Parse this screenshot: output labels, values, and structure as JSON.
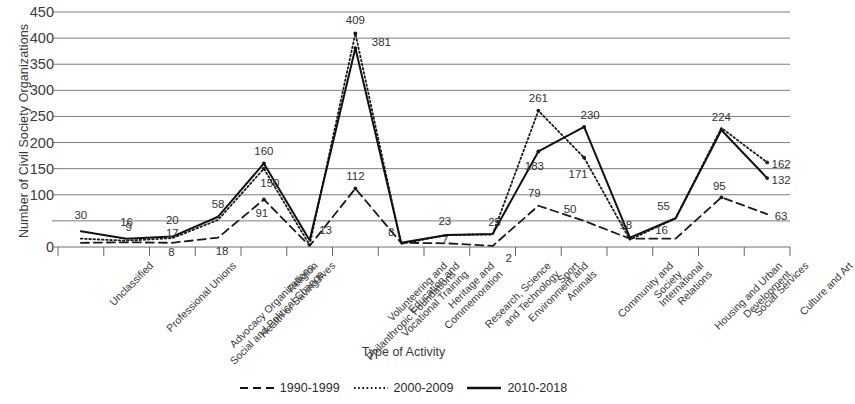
{
  "chart_data": {
    "type": "line",
    "title": "",
    "xlabel": "Type of Activity",
    "ylabel": "Number of Civil Society Organizations",
    "ylim": [
      0,
      450
    ],
    "yticks": [
      0,
      50,
      100,
      150,
      200,
      250,
      300,
      350,
      400,
      450
    ],
    "ytick_labels": [
      "0",
      "50",
      "100",
      "150",
      "200",
      "250",
      "300",
      "350",
      "400",
      "450"
    ],
    "grid": true,
    "legend_position": "bottom",
    "categories": [
      "Unclassified",
      "Professional Unions",
      "Advocacy Organizations,\nSocial and Political Change",
      "Health or Saving lives",
      "Religion",
      "Volunteering and\nPhilanthropic Foundations",
      "Education and\nVocational Training",
      "Heritage and\nCommemoration",
      "Research, Science\nand Technology",
      "Environment and\nAnimals",
      "Sport",
      "Community and\nSociety",
      "International\nRelations",
      "Housing and Urban\nDevelopment",
      "Social Services",
      "Culture and Art"
    ],
    "series": [
      {
        "name": "1990-1999",
        "style": "dashed",
        "color": "#1a1a1a",
        "values": [
          8,
          9,
          8,
          18,
          91,
          2,
          112,
          8,
          7,
          2,
          79,
          50,
          16,
          16,
          95,
          63
        ]
      },
      {
        "name": "2000-2009",
        "style": "dotted",
        "color": "#1a1a1a",
        "values": [
          16,
          12,
          17,
          52,
          150,
          4,
          409,
          6,
          23,
          24,
          261,
          171,
          14,
          55,
          228,
          162
        ]
      },
      {
        "name": "2010-2018",
        "style": "solid",
        "color": "#111111",
        "values": [
          30,
          16,
          20,
          58,
          160,
          13,
          381,
          8,
          23,
          25,
          183,
          230,
          18,
          55,
          224,
          132
        ]
      }
    ],
    "data_labels": [
      {
        "text": "30",
        "series": "2010-2018",
        "category_index": 0,
        "value": 30
      },
      {
        "text": "16",
        "series": "2010-2018",
        "category_index": 1,
        "value": 16
      },
      {
        "text": "9",
        "series": "1990-1999",
        "category_index": 1,
        "value": 9
      },
      {
        "text": "20",
        "series": "2010-2018",
        "category_index": 2,
        "value": 20
      },
      {
        "text": "17",
        "series": "2000-2009",
        "category_index": 2,
        "value": 17
      },
      {
        "text": "8",
        "series": "1990-1999",
        "category_index": 2,
        "value": 8
      },
      {
        "text": "58",
        "series": "2010-2018",
        "category_index": 3,
        "value": 58
      },
      {
        "text": "18",
        "series": "1990-1999",
        "category_index": 3,
        "value": 18
      },
      {
        "text": "160",
        "series": "2010-2018",
        "category_index": 4,
        "value": 160
      },
      {
        "text": "150",
        "series": "2000-2009",
        "category_index": 4,
        "value": 150
      },
      {
        "text": "91",
        "series": "1990-1999",
        "category_index": 4,
        "value": 91
      },
      {
        "text": "13",
        "series": "2010-2018",
        "category_index": 5,
        "value": 13
      },
      {
        "text": "409",
        "series": "2000-2009",
        "category_index": 6,
        "value": 409
      },
      {
        "text": "381",
        "series": "2010-2018",
        "category_index": 6,
        "value": 381
      },
      {
        "text": "112",
        "series": "1990-1999",
        "category_index": 6,
        "value": 112
      },
      {
        "text": "8",
        "series": "1990-1999",
        "category_index": 7,
        "value": 8
      },
      {
        "text": "23",
        "series": "2010-2018",
        "category_index": 8,
        "value": 23
      },
      {
        "text": "7",
        "series": "1990-1999",
        "category_index": 8,
        "value": 7
      },
      {
        "text": "25",
        "series": "2010-2018",
        "category_index": 9,
        "value": 25
      },
      {
        "text": "2",
        "series": "1990-1999",
        "category_index": 9,
        "value": 2
      },
      {
        "text": "261",
        "series": "2000-2009",
        "category_index": 10,
        "value": 261
      },
      {
        "text": "183",
        "series": "2010-2018",
        "category_index": 10,
        "value": 183
      },
      {
        "text": "79",
        "series": "1990-1999",
        "category_index": 10,
        "value": 79
      },
      {
        "text": "230",
        "series": "2010-2018",
        "category_index": 11,
        "value": 230
      },
      {
        "text": "171",
        "series": "2000-2009",
        "category_index": 11,
        "value": 171
      },
      {
        "text": "50",
        "series": "1990-1999",
        "category_index": 11,
        "value": 50
      },
      {
        "text": "18",
        "series": "2010-2018",
        "category_index": 12,
        "value": 18
      },
      {
        "text": "16",
        "series": "1990-1999",
        "category_index": 13,
        "value": 16
      },
      {
        "text": "55",
        "series": "2010-2018",
        "category_index": 13,
        "value": 55
      },
      {
        "text": "224",
        "series": "2010-2018",
        "category_index": 14,
        "value": 224
      },
      {
        "text": "95",
        "series": "1990-1999",
        "category_index": 14,
        "value": 95
      },
      {
        "text": "162",
        "series": "2000-2009",
        "category_index": 15,
        "value": 162
      },
      {
        "text": "132",
        "series": "2010-2018",
        "category_index": 15,
        "value": 132
      },
      {
        "text": "63",
        "series": "1990-1999",
        "category_index": 15,
        "value": 63
      }
    ]
  },
  "legend": {
    "items": [
      {
        "label": "1990-1999",
        "style": "dashed"
      },
      {
        "label": "2000-2009",
        "style": "dotted"
      },
      {
        "label": "2010-2018",
        "style": "solid"
      }
    ]
  },
  "colors": {
    "axis": "#555555",
    "grid": "#6e6e6e",
    "text": "#3a3a3a",
    "series": "#111111"
  }
}
